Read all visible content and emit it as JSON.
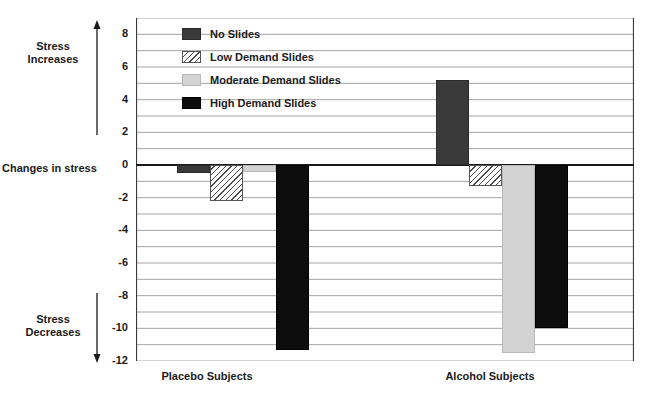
{
  "annotations": {
    "stress_increases": "Stress\nIncreases",
    "stress_decreases": "Stress\nDecreases",
    "zero_axis_label": "Changes in stress",
    "arrow_up_name": "arrow-up-icon",
    "arrow_down_name": "arrow-down-icon"
  },
  "colors": {
    "no_slides": "#3a3a3a",
    "low_demand": "#ffffff",
    "low_demand_hatch": "#4a4a4a",
    "moderate_demand": "#d3d3d3",
    "high_demand": "#0d0d0d",
    "gridline": "#9a9a9a",
    "axis": "#1a1a1a",
    "background": "#ffffff"
  },
  "chart_data": {
    "type": "bar",
    "title": "",
    "subtitle": "",
    "xlabel": "",
    "ylabel": "Changes in stress",
    "categories": [
      "Placebo Subjects",
      "Alcohol Subjects"
    ],
    "series": [
      {
        "name": "No Slides",
        "values": [
          -0.5,
          5.2
        ]
      },
      {
        "name": "Low Demand Slides",
        "values": [
          -2.2,
          -1.3
        ]
      },
      {
        "name": "Moderate Demand Slides",
        "values": [
          -0.4,
          -11.5
        ]
      },
      {
        "name": "High Demand Slides",
        "values": [
          -11.3,
          -10.0
        ]
      }
    ],
    "ylim": [
      -12,
      9
    ],
    "yticks": [
      8,
      6,
      4,
      2,
      0,
      -2,
      -4,
      -6,
      -8,
      -10,
      -12
    ],
    "ytick_labels": [
      "8",
      "6",
      "4",
      "2",
      "0",
      "-2",
      "-4",
      "-6",
      "-8",
      "-10",
      "-12"
    ],
    "gridline_step": 1,
    "grid": true,
    "legend_position": "top-left",
    "legend": [
      "No Slides",
      "Low Demand Slides",
      "Moderate Demand Slides",
      "High Demand Slides"
    ]
  }
}
